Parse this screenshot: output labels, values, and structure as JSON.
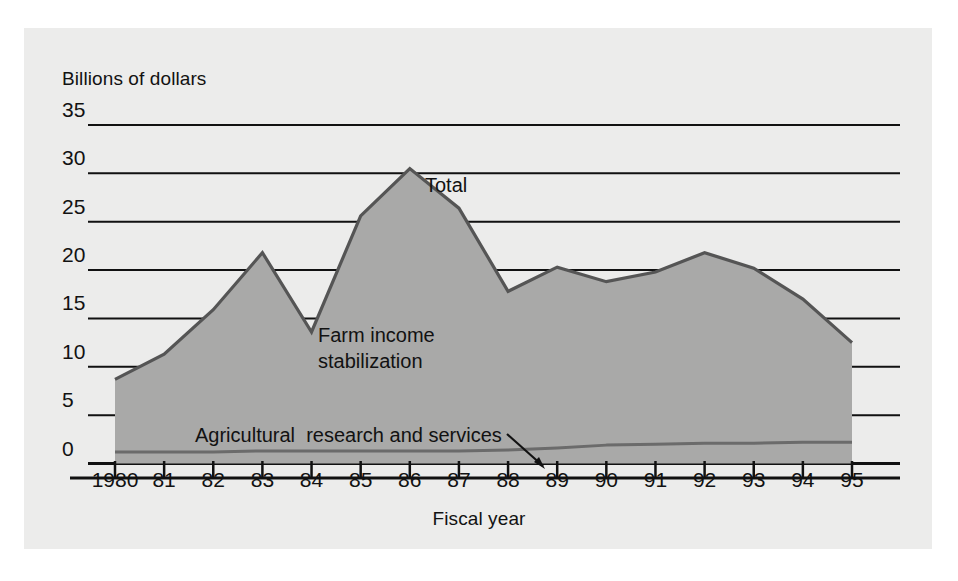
{
  "figure": {
    "y_axis_title": "Billions of dollars",
    "x_axis_title": "Fiscal year",
    "labels": {
      "total": "Total",
      "farm_income": "Farm income\nstabilization",
      "agricultural": "Agricultural  research and services"
    },
    "colors": {
      "panel_background": "#ececeb",
      "area_fill": "#a9a9a8",
      "line": "#555555",
      "gridline": "#111111",
      "text": "#121212"
    }
  },
  "chart_data": {
    "type": "area",
    "title": "",
    "xlabel": "Fiscal year",
    "ylabel": "Billions of dollars",
    "xlim": [
      1980,
      1995
    ],
    "ylim": [
      0,
      35
    ],
    "ytick_values": [
      0,
      5,
      10,
      15,
      20,
      25,
      30,
      35
    ],
    "ytick_labels": [
      "0",
      "5",
      "10",
      "15",
      "20",
      "25",
      "30",
      "35"
    ],
    "grid": true,
    "legend": "inline-annotations",
    "categories": [
      1980,
      1981,
      1982,
      1983,
      1984,
      1985,
      1986,
      1987,
      1988,
      1989,
      1990,
      1991,
      1992,
      1993,
      1994,
      1995
    ],
    "xtick_labels": [
      "1980",
      "81",
      "82",
      "83",
      "84",
      "85",
      "86",
      "87",
      "88",
      "89",
      "90",
      "91",
      "92",
      "93",
      "94",
      "95"
    ],
    "series": [
      {
        "name": "Total",
        "values": [
          8.7,
          11.3,
          15.9,
          21.8,
          13.6,
          25.6,
          30.5,
          26.4,
          17.8,
          20.3,
          18.8,
          19.8,
          21.8,
          20.2,
          17.0,
          12.5
        ]
      },
      {
        "name": "Agricultural  research and services",
        "values": [
          1.2,
          1.2,
          1.2,
          1.3,
          1.3,
          1.3,
          1.3,
          1.3,
          1.4,
          1.6,
          1.9,
          2.0,
          2.1,
          2.1,
          2.2,
          2.2
        ]
      }
    ],
    "annotations": [
      {
        "text": "Total",
        "x": 1987.1,
        "y": 27.2
      },
      {
        "text": "Farm income\nstabilization",
        "x": 1984.2,
        "y": 14.2
      },
      {
        "text": "Agricultural  research and services",
        "x": 1981.6,
        "y": 4.2
      }
    ]
  }
}
